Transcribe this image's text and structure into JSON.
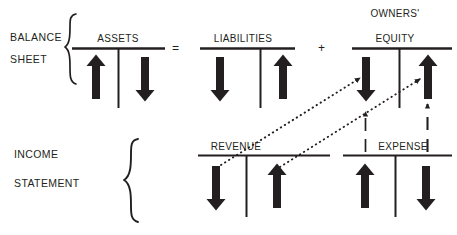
{
  "diagram": {
    "background_color": "#ffffff",
    "ink_color": "#231f20",
    "width": 457,
    "height": 235
  },
  "sections": [
    {
      "id": "balance-sheet",
      "line1": "BALANCE",
      "line2": "SHEET"
    },
    {
      "id": "income-statement",
      "line1": "INCOME",
      "line2": "STATEMENT"
    }
  ],
  "operators": [
    {
      "id": "equals",
      "symbol": "="
    },
    {
      "id": "plus",
      "symbol": "+"
    }
  ],
  "accounts": [
    {
      "id": "assets",
      "title": "ASSETS",
      "title_lines": [
        "ASSETS"
      ],
      "section": "balance-sheet",
      "debit_side": {
        "side": "left",
        "arrow": "up",
        "meaning": "increase"
      },
      "credit_side": {
        "side": "right",
        "arrow": "down",
        "meaning": "decrease"
      }
    },
    {
      "id": "liabilities",
      "title": "LIABILITIES",
      "title_lines": [
        "LIABILITIES"
      ],
      "section": "balance-sheet",
      "debit_side": {
        "side": "left",
        "arrow": "down",
        "meaning": "decrease"
      },
      "credit_side": {
        "side": "right",
        "arrow": "up",
        "meaning": "increase"
      }
    },
    {
      "id": "owners-equity",
      "title": "OWNERS' EQUITY",
      "title_lines": [
        "OWNERS'",
        "EQUITY"
      ],
      "section": "balance-sheet",
      "debit_side": {
        "side": "left",
        "arrow": "down",
        "meaning": "decrease"
      },
      "credit_side": {
        "side": "right",
        "arrow": "up",
        "meaning": "increase"
      }
    },
    {
      "id": "revenue",
      "title": "REVENUE",
      "title_lines": [
        "REVENUE"
      ],
      "section": "income-statement",
      "debit_side": {
        "side": "left",
        "arrow": "down",
        "meaning": "decrease"
      },
      "credit_side": {
        "side": "right",
        "arrow": "up",
        "meaning": "increase"
      }
    },
    {
      "id": "expense",
      "title": "EXPENSE",
      "title_lines": [
        "EXPENSE"
      ],
      "section": "income-statement",
      "debit_side": {
        "side": "left",
        "arrow": "up",
        "meaning": "increase"
      },
      "credit_side": {
        "side": "right",
        "arrow": "down",
        "meaning": "decrease"
      }
    }
  ],
  "connectors": [
    {
      "id": "revenue-debit-to-equity-debit",
      "style": "dotted",
      "direction": "diagonal-up-right",
      "from": "revenue.debit",
      "to": "owners-equity.debit"
    },
    {
      "id": "revenue-credit-to-equity-credit",
      "style": "dotted",
      "direction": "diagonal-up-right",
      "from": "revenue.credit",
      "to": "owners-equity.credit"
    },
    {
      "id": "expense-debit-to-equity-debit",
      "style": "dashed",
      "direction": "vertical-up",
      "from": "expense.debit",
      "to": "owners-equity.debit"
    },
    {
      "id": "expense-credit-to-equity-credit",
      "style": "dashed",
      "direction": "vertical-up",
      "from": "expense.credit",
      "to": "owners-equity.credit"
    }
  ]
}
